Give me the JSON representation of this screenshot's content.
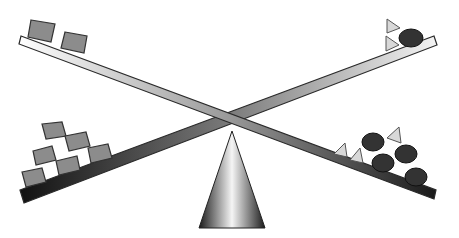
{
  "diagram": {
    "description": "Two crossed seesaw beams balanced on a cone fulcrum",
    "beams": [
      {
        "id": "beam-a",
        "from": [
          20,
          38
        ],
        "to": [
          437,
          198
        ],
        "style": "gradient light-to-dark",
        "left_end_load": {
          "type": "square",
          "count": 2,
          "color": "#8c8c8c"
        },
        "right_end_load": {
          "type": "mixed",
          "triangles": 3,
          "ovals": 4
        }
      },
      {
        "id": "beam-b",
        "from": [
          24,
          196
        ],
        "to": [
          437,
          40
        ],
        "style": "gradient dark-to-light",
        "left_end_load": {
          "type": "square",
          "count": 6,
          "color": "#8c8c8c"
        },
        "right_end_load": {
          "type": "mixed",
          "triangles": 2,
          "ovals": 1
        }
      }
    ],
    "fulcrum": {
      "shape": "cone",
      "base_width": 80,
      "height": 103
    },
    "colors": {
      "square": "#8c8c8c",
      "oval": "#333333",
      "triangle": "#d8d8d8",
      "outline": "#2a2a2a"
    }
  }
}
